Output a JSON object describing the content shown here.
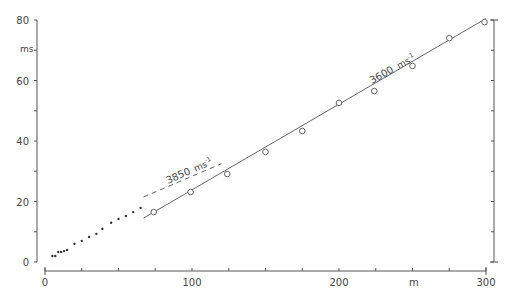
{
  "chart_data": {
    "type": "scatter",
    "title": "",
    "xlabel": "m",
    "ylabel": "ms",
    "xlim": [
      0,
      300
    ],
    "ylim": [
      0,
      80
    ],
    "x_ticks": [
      0,
      100,
      200,
      300
    ],
    "x_minor_step": 25,
    "y_ticks": [
      0,
      20,
      40,
      60,
      80
    ],
    "y_minor_step": 10,
    "grid": false,
    "series": [
      {
        "name": "near points",
        "marker": "dot",
        "x": [
          5,
          7,
          9,
          11,
          13,
          15,
          20,
          25,
          30,
          35,
          39,
          45,
          50,
          55,
          60,
          65
        ],
        "y": [
          2.0,
          2.0,
          3.3,
          3.3,
          3.6,
          4.0,
          6.0,
          7.0,
          8.3,
          9.3,
          11.0,
          13.0,
          14.2,
          15.2,
          16.5,
          17.9
        ]
      },
      {
        "name": "far points",
        "marker": "open-circle",
        "x": [
          74,
          99,
          124,
          150,
          175,
          200,
          224,
          250,
          275,
          299
        ],
        "y": [
          16.5,
          23.1,
          29.1,
          36.4,
          43.3,
          52.6,
          56.5,
          64.8,
          74.0,
          79.3
        ]
      }
    ],
    "fit_lines": [
      {
        "name": "3600 fit",
        "style": "solid",
        "x": [
          67,
          300
        ],
        "y": [
          14.5,
          80.5
        ],
        "label": "3600 ms⁻¹"
      },
      {
        "name": "3850 fit",
        "style": "dashed",
        "x": [
          67,
          120
        ],
        "y": [
          21.5,
          32.5
        ],
        "label": "3850 ms⁻¹"
      }
    ],
    "annotations": [
      {
        "text": "3850 ms⁻¹",
        "x": 90,
        "y": 27
      },
      {
        "text": "3600 ms⁻¹",
        "x": 233,
        "y": 64
      }
    ]
  },
  "labels": {
    "y_unit": "ms",
    "x_unit": "m",
    "y_tick_labels": [
      "0",
      "20",
      "40",
      "60",
      "80"
    ],
    "x_tick_labels": [
      "0",
      "100",
      "200",
      "300"
    ],
    "annotation_3850": "3850",
    "annotation_3600": "3600",
    "velocity_unit": "ms",
    "velocity_exp": "-1"
  }
}
